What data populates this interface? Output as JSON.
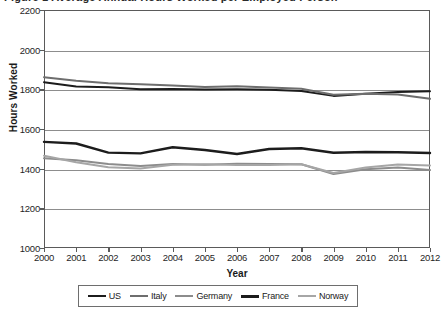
{
  "figure": {
    "title_partial": "Figure 1  Average Annual Hours Worked per Employed Person",
    "background": "#ffffff"
  },
  "chart_data": {
    "type": "line",
    "title": "",
    "xlabel": "Year",
    "ylabel": "Hours Worked",
    "x": [
      2000,
      2001,
      2002,
      2003,
      2004,
      2005,
      2006,
      2007,
      2008,
      2009,
      2010,
      2011,
      2012
    ],
    "xlim": [
      2000,
      2012
    ],
    "ylim": [
      1000,
      2200
    ],
    "yticks": [
      1000,
      1200,
      1400,
      1600,
      1800,
      2000,
      2200
    ],
    "xticks": [
      2000,
      2001,
      2002,
      2003,
      2004,
      2005,
      2006,
      2007,
      2008,
      2009,
      2010,
      2011,
      2012
    ],
    "grid": true,
    "grid_axis": "y",
    "legend_position": "bottom",
    "series": [
      {
        "name": "US",
        "color": "#1c1c1c",
        "width": 2.0,
        "values": [
          1836,
          1814,
          1810,
          1800,
          1802,
          1799,
          1800,
          1798,
          1792,
          1767,
          1778,
          1786,
          1790
        ]
      },
      {
        "name": "Italy",
        "color": "#6e6e6e",
        "width": 2.0,
        "values": [
          1861,
          1843,
          1831,
          1826,
          1819,
          1812,
          1815,
          1809,
          1803,
          1773,
          1778,
          1774,
          1752
        ]
      },
      {
        "name": "Germany",
        "color": "#8c8c8c",
        "width": 2.0,
        "values": [
          1452,
          1442,
          1424,
          1414,
          1424,
          1420,
          1425,
          1424,
          1422,
          1373,
          1397,
          1406,
          1393
        ]
      },
      {
        "name": "France",
        "color": "#1c1c1c",
        "width": 2.4,
        "values": [
          1535,
          1527,
          1481,
          1477,
          1508,
          1494,
          1474,
          1499,
          1503,
          1480,
          1484,
          1483,
          1479
        ]
      },
      {
        "name": "Norway",
        "color": "#a6a6a6",
        "width": 2.0,
        "values": [
          1465,
          1432,
          1407,
          1401,
          1420,
          1422,
          1418,
          1418,
          1422,
          1378,
          1406,
          1421,
          1416
        ]
      }
    ]
  },
  "legend": {
    "items": [
      {
        "label": "US",
        "color": "#1c1c1c",
        "width": 2.6
      },
      {
        "label": "Italy",
        "color": "#6e6e6e",
        "width": 2.2
      },
      {
        "label": "Germany",
        "color": "#8c8c8c",
        "width": 2.2
      },
      {
        "label": "France",
        "color": "#1c1c1c",
        "width": 3.2
      },
      {
        "label": "Norway",
        "color": "#a6a6a6",
        "width": 2.2
      }
    ]
  }
}
